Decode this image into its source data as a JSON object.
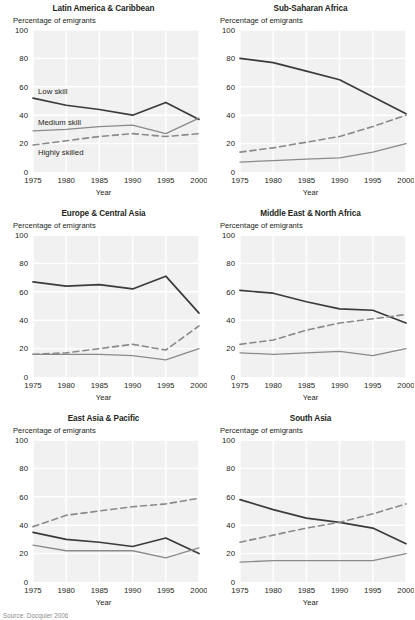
{
  "figure": {
    "axis_y_label": "Percentage of emigrants",
    "axis_x_label": "Year",
    "source_note": "Source: Docquier 2006",
    "colors": {
      "low_skill": "#3b3b3b",
      "medium_skill": "#8a8a8a",
      "highly_skilled": "#8a8a8a",
      "plot_background": "#f1f1f1",
      "gridline": "#ffffff",
      "text": "#231f20"
    },
    "legend": {
      "low_skill": "Low skill",
      "medium_skill": "Medium skill",
      "highly_skilled": "Highly skilled",
      "shown_in_panel": "Latin America & Caribbean"
    }
  },
  "chart_data": [
    {
      "type": "line",
      "title": "Latin America & Caribbean",
      "xlabel": "Year",
      "ylabel": "Percentage of emigrants",
      "x": [
        1975,
        1980,
        1985,
        1990,
        1995,
        2000
      ],
      "xtick_labels": [
        "1975",
        "1980",
        "1985",
        "1990",
        "1995",
        "2000"
      ],
      "ytick_labels": [
        "0",
        "20",
        "40",
        "60",
        "80",
        "100"
      ],
      "ylim": [
        0,
        100
      ],
      "grid": true,
      "legend_position": "inline-annotations",
      "series": [
        {
          "name": "Low skill",
          "values": [
            52,
            47,
            44,
            40,
            49,
            37
          ],
          "style": "solid",
          "color": "#3b3b3b"
        },
        {
          "name": "Medium skill",
          "values": [
            29,
            30,
            32,
            33,
            27,
            38
          ],
          "style": "solid",
          "color": "#8a8a8a"
        },
        {
          "name": "Highly skilled",
          "values": [
            19,
            22,
            25,
            27,
            25,
            27
          ],
          "style": "dashed",
          "color": "#8a8a8a"
        }
      ]
    },
    {
      "type": "line",
      "title": "Sub-Saharan Africa",
      "xlabel": "Year",
      "ylabel": "Percentage of emigrants",
      "x": [
        1975,
        1980,
        1985,
        1990,
        1995,
        2000
      ],
      "xtick_labels": [
        "1975",
        "1980",
        "1985",
        "1990",
        "1995",
        "2000"
      ],
      "ytick_labels": [
        "0",
        "20",
        "40",
        "60",
        "80",
        "100"
      ],
      "ylim": [
        0,
        100
      ],
      "grid": true,
      "series": [
        {
          "name": "Low skill",
          "values": [
            80,
            77,
            71,
            65,
            53,
            41
          ],
          "style": "solid",
          "color": "#3b3b3b"
        },
        {
          "name": "Medium skill",
          "values": [
            7,
            8,
            9,
            10,
            14,
            20
          ],
          "style": "solid",
          "color": "#8a8a8a"
        },
        {
          "name": "Highly skilled",
          "values": [
            14,
            17,
            21,
            25,
            32,
            40
          ],
          "style": "dashed",
          "color": "#8a8a8a"
        }
      ]
    },
    {
      "type": "line",
      "title": "Europe & Central Asia",
      "xlabel": "Year",
      "ylabel": "Percentage of emigrants",
      "x": [
        1975,
        1980,
        1985,
        1990,
        1995,
        2000
      ],
      "xtick_labels": [
        "1975",
        "1980",
        "1985",
        "1990",
        "1995",
        "2000"
      ],
      "ytick_labels": [
        "0",
        "20",
        "40",
        "60",
        "80",
        "100"
      ],
      "ylim": [
        0,
        100
      ],
      "grid": true,
      "series": [
        {
          "name": "Low skill",
          "values": [
            67,
            64,
            65,
            62,
            71,
            45
          ],
          "style": "solid",
          "color": "#3b3b3b"
        },
        {
          "name": "Medium skill",
          "values": [
            16,
            16,
            16,
            15,
            12,
            20
          ],
          "style": "solid",
          "color": "#8a8a8a"
        },
        {
          "name": "Highly skilled",
          "values": [
            16,
            17,
            20,
            23,
            19,
            36
          ],
          "style": "dashed",
          "color": "#8a8a8a"
        }
      ]
    },
    {
      "type": "line",
      "title": "Middle East & North Africa",
      "xlabel": "Year",
      "ylabel": "Percentage of emigrants",
      "x": [
        1975,
        1980,
        1985,
        1990,
        1995,
        2000
      ],
      "xtick_labels": [
        "1975",
        "1980",
        "1985",
        "1990",
        "1995",
        "2000"
      ],
      "ytick_labels": [
        "0",
        "20",
        "40",
        "60",
        "80",
        "100"
      ],
      "ylim": [
        0,
        100
      ],
      "grid": true,
      "series": [
        {
          "name": "Low skill",
          "values": [
            61,
            59,
            53,
            48,
            47,
            38
          ],
          "style": "solid",
          "color": "#3b3b3b"
        },
        {
          "name": "Medium skill",
          "values": [
            17,
            16,
            17,
            18,
            15,
            20
          ],
          "style": "solid",
          "color": "#8a8a8a"
        },
        {
          "name": "Highly skilled",
          "values": [
            23,
            26,
            33,
            38,
            41,
            44
          ],
          "style": "dashed",
          "color": "#8a8a8a"
        }
      ]
    },
    {
      "type": "line",
      "title": "East Asia & Pacific",
      "xlabel": "Year",
      "ylabel": "Percentage of emigrants",
      "x": [
        1975,
        1980,
        1985,
        1990,
        1995,
        2000
      ],
      "xtick_labels": [
        "1975",
        "1980",
        "1985",
        "1990",
        "1995",
        "2000"
      ],
      "ytick_labels": [
        "0",
        "20",
        "40",
        "60",
        "80",
        "100"
      ],
      "ylim": [
        0,
        100
      ],
      "grid": true,
      "series": [
        {
          "name": "Low skill",
          "values": [
            35,
            30,
            28,
            25,
            31,
            20
          ],
          "style": "solid",
          "color": "#3b3b3b"
        },
        {
          "name": "Medium skill",
          "values": [
            26,
            22,
            22,
            22,
            17,
            24
          ],
          "style": "solid",
          "color": "#8a8a8a"
        },
        {
          "name": "Highly skilled",
          "values": [
            39,
            47,
            50,
            53,
            55,
            59
          ],
          "style": "dashed",
          "color": "#8a8a8a"
        }
      ]
    },
    {
      "type": "line",
      "title": "South Asia",
      "xlabel": "Year",
      "ylabel": "Percentage of emigrants",
      "x": [
        1975,
        1980,
        1985,
        1990,
        1995,
        2000
      ],
      "xtick_labels": [
        "1975",
        "1980",
        "1985",
        "1990",
        "1995",
        "2000"
      ],
      "ytick_labels": [
        "0",
        "20",
        "40",
        "60",
        "80",
        "100"
      ],
      "ylim": [
        0,
        100
      ],
      "grid": true,
      "series": [
        {
          "name": "Low skill",
          "values": [
            58,
            51,
            45,
            42,
            38,
            27
          ],
          "style": "solid",
          "color": "#3b3b3b"
        },
        {
          "name": "Medium skill",
          "values": [
            14,
            15,
            15,
            15,
            15,
            20
          ],
          "style": "solid",
          "color": "#8a8a8a"
        },
        {
          "name": "Highly skilled",
          "values": [
            28,
            33,
            38,
            42,
            48,
            55
          ],
          "style": "dashed",
          "color": "#8a8a8a"
        }
      ]
    }
  ]
}
